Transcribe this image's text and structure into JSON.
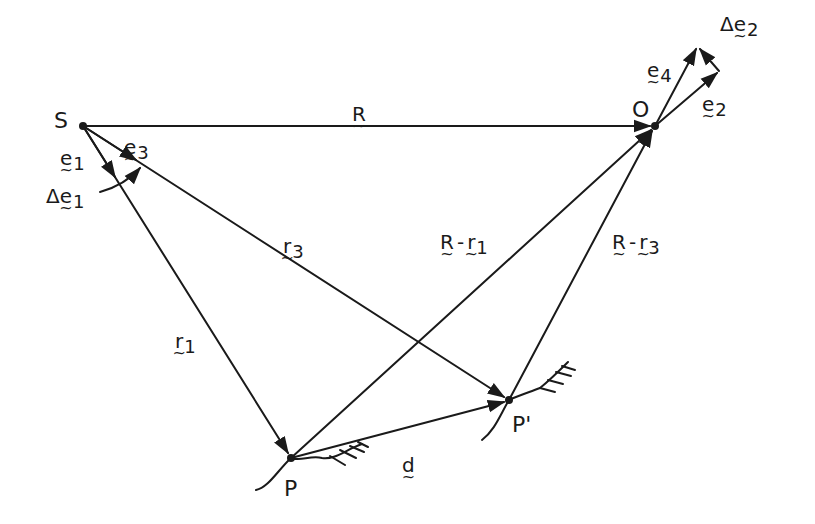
{
  "diagram": {
    "points": {
      "S": {
        "label": "S",
        "x": 83,
        "y": 126
      },
      "O": {
        "label": "O",
        "x": 655,
        "y": 126
      },
      "P": {
        "label": "P",
        "x": 291,
        "y": 458
      },
      "P_prime": {
        "label": "P'",
        "x": 509,
        "y": 400
      }
    },
    "vectors": {
      "R": {
        "base": "R",
        "sub": ""
      },
      "r1": {
        "base": "r",
        "sub": "1"
      },
      "r3": {
        "base": "r",
        "sub": "3"
      },
      "d": {
        "base": "d",
        "sub": ""
      },
      "e1": {
        "base": "e",
        "sub": "1"
      },
      "e2": {
        "base": "e",
        "sub": "2"
      },
      "e3": {
        "base": "e",
        "sub": "3"
      },
      "e4": {
        "base": "e",
        "sub": "4"
      },
      "delta_e1": {
        "prefix": "Δ",
        "base": "e",
        "sub": "1"
      },
      "delta_e2": {
        "prefix": "Δ",
        "base": "e",
        "sub": "2"
      },
      "R_minus_r1": {
        "a": "R",
        "op": "-",
        "b": "r",
        "sub": "1"
      },
      "R_minus_r3": {
        "a": "R",
        "op": "-",
        "b": "r",
        "sub": "3"
      }
    },
    "stroke_color": "#1a1a1a"
  }
}
